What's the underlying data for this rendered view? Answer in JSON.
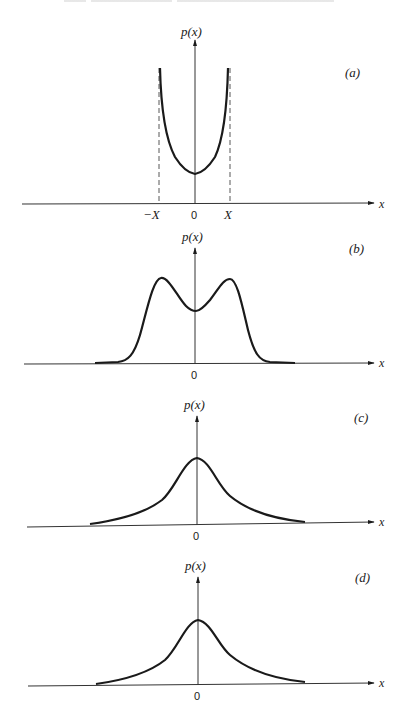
{
  "header": {
    "running_head": ""
  },
  "panels": [
    {
      "id": "a",
      "label": "(a)",
      "ylabel": "p(x)",
      "xlabel": "x",
      "ticks": {
        "neg": "−X",
        "zero": "0",
        "pos": "X"
      },
      "description": "U-shaped density bounded between -X and X with dashed asymptote lines"
    },
    {
      "id": "b",
      "label": "(b)",
      "ylabel": "p(x)",
      "xlabel": "x",
      "ticks": {
        "zero": "0"
      },
      "description": "Bimodal density with two symmetric peaks and a dip at 0"
    },
    {
      "id": "c",
      "label": "(c)",
      "ylabel": "p(x)",
      "xlabel": "x",
      "ticks": {
        "zero": "0"
      },
      "description": "Unimodal bell-shaped density centered at 0 with heavy tails"
    },
    {
      "id": "d",
      "label": "(d)",
      "ylabel": "p(x)",
      "xlabel": "x",
      "ticks": {
        "zero": "0"
      },
      "description": "Unimodal bell-shaped density centered at 0 with heavy tails"
    }
  ],
  "colors": {
    "ink": "#1a1a1a",
    "axis": "#333333",
    "background": "#ffffff"
  }
}
